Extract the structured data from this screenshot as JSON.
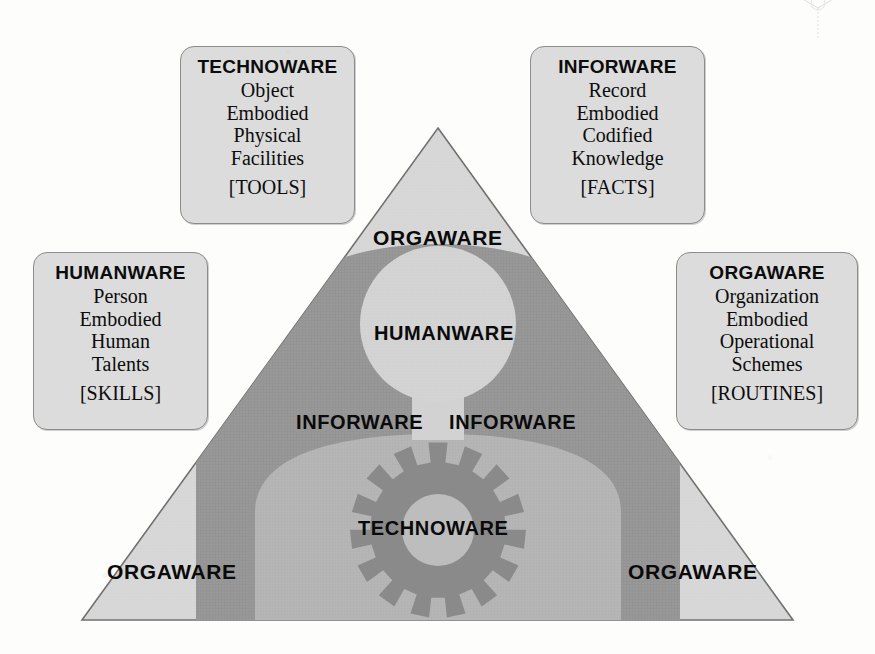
{
  "diagram": {
    "colors": {
      "page_background": "#fdfdfc",
      "triangle_orgaware": "#d6d6d6",
      "inforware_band": "#949494",
      "technoware_arch": "#b3b3b3",
      "gear": "#8a8a8a",
      "gear_hub": "#bdbdbd",
      "humanware_circle": "#d2d2d2",
      "box_fill": "#dcdcdc",
      "box_border": "#8c8c8c",
      "text": "#0a0a0a"
    },
    "boxes": [
      {
        "id": "technoware",
        "title": "TECHNOWARE",
        "lines": [
          "Object",
          "Embodied",
          "Physical",
          "Facilities"
        ],
        "tag": "[TOOLS]"
      },
      {
        "id": "inforware",
        "title": "INFORWARE",
        "lines": [
          "Record",
          "Embodied",
          "Codified",
          "Knowledge"
        ],
        "tag": "[FACTS]"
      },
      {
        "id": "humanware",
        "title": "HUMANWARE",
        "lines": [
          "Person",
          "Embodied",
          "Human",
          "Talents"
        ],
        "tag": "[SKILLS]"
      },
      {
        "id": "orgaware",
        "title": "ORGAWARE",
        "lines": [
          "Organization",
          "Embodied",
          "Operational",
          "Schemes"
        ],
        "tag": "[ROUTINES]"
      }
    ],
    "labels": {
      "orgaware_top": "ORGAWARE",
      "humanware_center": "HUMANWARE",
      "inforware_left": "INFORWARE",
      "inforware_right": "INFORWARE",
      "technoware_center": "TECHNOWARE",
      "orgaware_bottom_left": "ORGAWARE",
      "orgaware_bottom_right": "ORGAWARE"
    },
    "shapes": {
      "triangle": {
        "apex_x": 438,
        "apex_y": 128,
        "left_x": 82,
        "right_x": 793,
        "base_y": 620
      },
      "humanware_circle": {
        "cx": 438,
        "cy": 324,
        "r": 78
      },
      "gear": {
        "cx": 438,
        "cy": 530,
        "r_outer": 88,
        "r_root": 68,
        "r_hub": 36,
        "teeth": 15
      }
    }
  }
}
